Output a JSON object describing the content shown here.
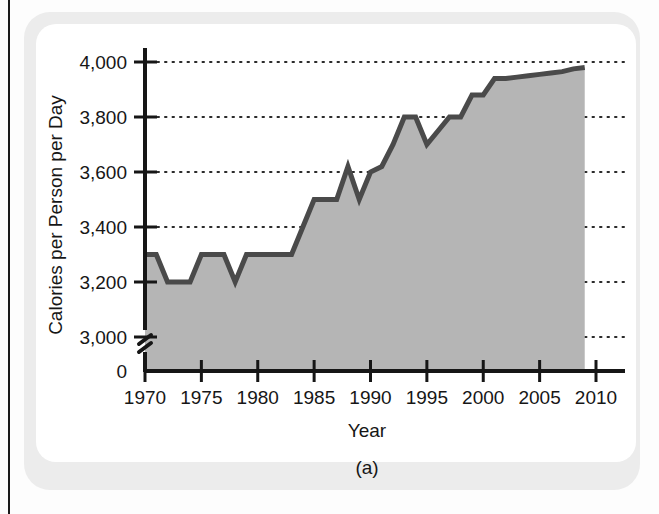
{
  "figure": {
    "caption": "(a)"
  },
  "chart_data": {
    "type": "area",
    "title": "",
    "xlabel": "Year",
    "ylabel": "Calories per Person per Day",
    "xlim": [
      1970,
      2010
    ],
    "ylim": [
      3000,
      4000
    ],
    "y_axis_break": true,
    "y_break_labels": [
      "3,000",
      "0"
    ],
    "grid": "horizontal-dotted",
    "legend": "none",
    "line_color": "#4a4a4a",
    "fill_color": "#b5b5b5",
    "axis_color": "#161616",
    "x_ticks": [
      1970,
      1975,
      1980,
      1985,
      1990,
      1995,
      2000,
      2005,
      2010
    ],
    "x_tick_labels": [
      "1970",
      "1975",
      "1980",
      "1985",
      "1990",
      "1995",
      "2000",
      "2005",
      "2010"
    ],
    "y_ticks": [
      3000,
      3200,
      3400,
      3600,
      3800,
      4000
    ],
    "y_tick_labels": [
      "3,000",
      "3,200",
      "3,400",
      "3,600",
      "3,800",
      "4,000"
    ],
    "y_zero_label": "0",
    "x": [
      1970,
      1971,
      1972,
      1973,
      1974,
      1975,
      1976,
      1977,
      1978,
      1979,
      1980,
      1981,
      1982,
      1983,
      1984,
      1985,
      1986,
      1987,
      1988,
      1989,
      1990,
      1991,
      1992,
      1993,
      1994,
      1995,
      1996,
      1997,
      1998,
      1999,
      2000,
      2001,
      2002,
      2003,
      2004,
      2005,
      2006,
      2007,
      2008,
      2009
    ],
    "values": [
      3300,
      3300,
      3200,
      3200,
      3200,
      3300,
      3300,
      3300,
      3200,
      3300,
      3300,
      3300,
      3300,
      3300,
      3400,
      3500,
      3500,
      3500,
      3620,
      3500,
      3600,
      3620,
      3700,
      3800,
      3800,
      3700,
      3750,
      3800,
      3800,
      3880,
      3880,
      3940,
      3940,
      3945,
      3950,
      3955,
      3960,
      3965,
      3975,
      3980
    ],
    "series": [
      {
        "name": "Calories per Person per Day",
        "values": [
          3300,
          3300,
          3200,
          3200,
          3200,
          3300,
          3300,
          3300,
          3200,
          3300,
          3300,
          3300,
          3300,
          3300,
          3400,
          3500,
          3500,
          3500,
          3620,
          3500,
          3600,
          3620,
          3700,
          3800,
          3800,
          3700,
          3750,
          3800,
          3800,
          3880,
          3880,
          3940,
          3940,
          3945,
          3950,
          3955,
          3960,
          3965,
          3975,
          3980
        ]
      }
    ]
  }
}
